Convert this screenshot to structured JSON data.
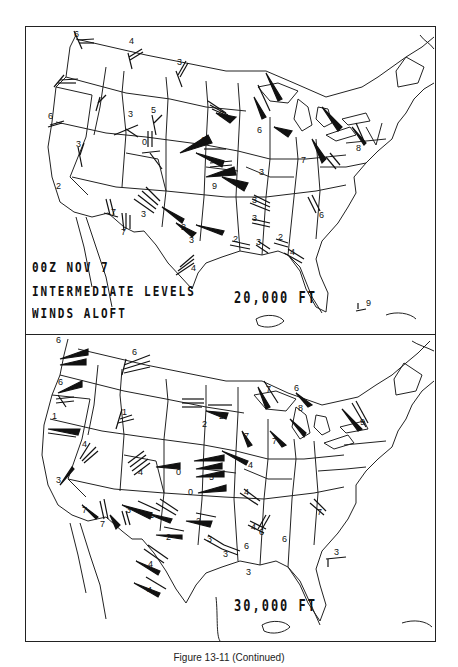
{
  "figure": {
    "caption": "Figure 13-11 (Continued)"
  },
  "panels": [
    {
      "id": "top",
      "title_lines": [
        "00Z NOV 7",
        "INTERMEDIATE LEVELS",
        "WINDS ALOFT"
      ],
      "level": "20,000 FT",
      "station_labels": [
        {
          "x": 48,
          "y": 10,
          "t": "6"
        },
        {
          "x": 103,
          "y": 17,
          "t": "4"
        },
        {
          "x": 151,
          "y": 38,
          "t": "3"
        },
        {
          "x": 22,
          "y": 92,
          "t": "6"
        },
        {
          "x": 102,
          "y": 90,
          "t": "3"
        },
        {
          "x": 125,
          "y": 86,
          "t": "5"
        },
        {
          "x": 116,
          "y": 118,
          "t": "0"
        },
        {
          "x": 193,
          "y": 90,
          "t": "3"
        },
        {
          "x": 175,
          "y": 116,
          "t": "6"
        },
        {
          "x": 231,
          "y": 106,
          "t": "6"
        },
        {
          "x": 330,
          "y": 124,
          "t": "8"
        },
        {
          "x": 275,
          "y": 136,
          "t": "7"
        },
        {
          "x": 233,
          "y": 148,
          "t": "3"
        },
        {
          "x": 186,
          "y": 162,
          "t": "9"
        },
        {
          "x": 50,
          "y": 120,
          "t": "3"
        },
        {
          "x": 30,
          "y": 162,
          "t": "2"
        },
        {
          "x": 85,
          "y": 188,
          "t": "7"
        },
        {
          "x": 95,
          "y": 208,
          "t": "7"
        },
        {
          "x": 115,
          "y": 190,
          "t": "3"
        },
        {
          "x": 155,
          "y": 203,
          "t": "2"
        },
        {
          "x": 163,
          "y": 216,
          "t": "3"
        },
        {
          "x": 226,
          "y": 176,
          "t": "3"
        },
        {
          "x": 226,
          "y": 194,
          "t": "3"
        },
        {
          "x": 207,
          "y": 215,
          "t": "2"
        },
        {
          "x": 230,
          "y": 218,
          "t": "3"
        },
        {
          "x": 252,
          "y": 213,
          "t": "2"
        },
        {
          "x": 264,
          "y": 228,
          "t": "4"
        },
        {
          "x": 293,
          "y": 191,
          "t": "6"
        },
        {
          "x": 165,
          "y": 244,
          "t": "4"
        },
        {
          "x": 340,
          "y": 279,
          "t": "9"
        }
      ]
    },
    {
      "id": "bottom",
      "title_lines": [],
      "level": "30,000 FT",
      "station_labels": [
        {
          "x": 30,
          "y": 8,
          "t": "6"
        },
        {
          "x": 106,
          "y": 20,
          "t": "6"
        },
        {
          "x": 32,
          "y": 50,
          "t": "6"
        },
        {
          "x": 96,
          "y": 80,
          "t": "1"
        },
        {
          "x": 26,
          "y": 84,
          "t": "1"
        },
        {
          "x": 56,
          "y": 112,
          "t": "4"
        },
        {
          "x": 112,
          "y": 140,
          "t": "4"
        },
        {
          "x": 176,
          "y": 92,
          "t": "2"
        },
        {
          "x": 193,
          "y": 84,
          "t": "2"
        },
        {
          "x": 240,
          "y": 57,
          "t": "7"
        },
        {
          "x": 268,
          "y": 56,
          "t": "6"
        },
        {
          "x": 334,
          "y": 90,
          "t": "9"
        },
        {
          "x": 272,
          "y": 76,
          "t": "8"
        },
        {
          "x": 246,
          "y": 109,
          "t": "7"
        },
        {
          "x": 218,
          "y": 104,
          "t": "7"
        },
        {
          "x": 222,
          "y": 133,
          "t": "4"
        },
        {
          "x": 150,
          "y": 140,
          "t": "0"
        },
        {
          "x": 183,
          "y": 145,
          "t": "5"
        },
        {
          "x": 162,
          "y": 160,
          "t": "0"
        },
        {
          "x": 30,
          "y": 148,
          "t": "3"
        },
        {
          "x": 56,
          "y": 178,
          "t": "7"
        },
        {
          "x": 74,
          "y": 192,
          "t": "7"
        },
        {
          "x": 100,
          "y": 178,
          "t": "3"
        },
        {
          "x": 123,
          "y": 183,
          "t": "1"
        },
        {
          "x": 140,
          "y": 205,
          "t": "2"
        },
        {
          "x": 170,
          "y": 189,
          "t": "2"
        },
        {
          "x": 218,
          "y": 160,
          "t": "4"
        },
        {
          "x": 225,
          "y": 195,
          "t": "4"
        },
        {
          "x": 181,
          "y": 207,
          "t": "3"
        },
        {
          "x": 197,
          "y": 222,
          "t": "3"
        },
        {
          "x": 218,
          "y": 214,
          "t": "6"
        },
        {
          "x": 233,
          "y": 200,
          "t": "6"
        },
        {
          "x": 291,
          "y": 180,
          "t": "7"
        },
        {
          "x": 256,
          "y": 207,
          "t": "6"
        },
        {
          "x": 122,
          "y": 232,
          "t": "4"
        },
        {
          "x": 121,
          "y": 258,
          "t": "4"
        },
        {
          "x": 308,
          "y": 220,
          "t": "3"
        },
        {
          "x": 220,
          "y": 240,
          "t": "3"
        }
      ]
    }
  ]
}
